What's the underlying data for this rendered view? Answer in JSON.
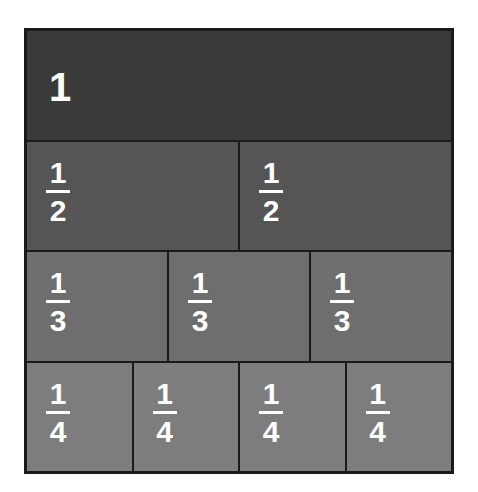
{
  "diagram": {
    "colors": {
      "row1": "#3a3a3a",
      "row2": "#555555",
      "row3": "#6e6e6e",
      "row4": "#7d7d7d",
      "border": "#1a1a1a"
    },
    "rows": [
      {
        "cells": [
          {
            "whole": "1"
          }
        ]
      },
      {
        "cells": [
          {
            "num": "1",
            "den": "2"
          },
          {
            "num": "1",
            "den": "2"
          }
        ]
      },
      {
        "cells": [
          {
            "num": "1",
            "den": "3"
          },
          {
            "num": "1",
            "den": "3"
          },
          {
            "num": "1",
            "den": "3"
          }
        ]
      },
      {
        "cells": [
          {
            "num": "1",
            "den": "4"
          },
          {
            "num": "1",
            "den": "4"
          },
          {
            "num": "1",
            "den": "4"
          },
          {
            "num": "1",
            "den": "4"
          }
        ]
      }
    ]
  }
}
